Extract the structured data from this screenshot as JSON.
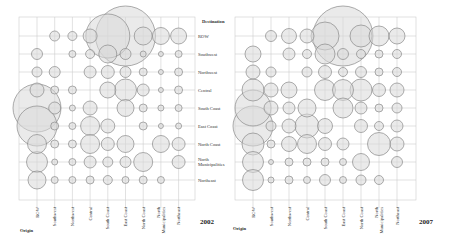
{
  "chart_data": [
    {
      "type": "bubble-matrix",
      "title": "2002",
      "xlabel": "Origin",
      "ylabel": "Destination",
      "categories_x": [
        "ROW",
        "Southwest",
        "Northwest",
        "Central",
        "South Coast",
        "East Coast",
        "North Coast",
        "North Municipalities",
        "Northeast"
      ],
      "categories_y": [
        "ROW",
        "Southwest",
        "Northwest",
        "Central",
        "South Coast",
        "East Coast",
        "North Coast",
        "North Municipalities",
        "Northeast"
      ],
      "grid": true,
      "radii_px": [
        [
          0,
          5,
          4.5,
          7,
          22,
          30,
          9,
          8.5,
          8
        ],
        [
          5.5,
          0,
          3.5,
          4.5,
          9,
          5.5,
          3,
          2.5,
          3.5
        ],
        [
          5,
          5.5,
          0,
          6,
          6.5,
          5.5,
          4,
          2.5,
          4
        ],
        [
          7,
          4,
          4,
          0,
          8,
          11,
          6,
          2.5,
          4
        ],
        [
          24,
          6,
          3,
          7,
          0,
          8.5,
          4,
          3,
          3.5
        ],
        [
          20,
          4,
          3.5,
          9.5,
          7,
          0,
          4,
          2.5,
          3
        ],
        [
          9.5,
          4,
          4,
          9.5,
          6.5,
          8.5,
          0,
          8.5,
          6.5
        ],
        [
          10.5,
          3,
          3.5,
          6,
          5,
          5.5,
          9.5,
          0,
          6.5
        ],
        [
          9,
          3.5,
          3.5,
          4,
          4.5,
          3.5,
          4,
          3.5,
          0
        ]
      ]
    },
    {
      "type": "bubble-matrix",
      "title": "2007",
      "xlabel": "Origin",
      "ylabel": "Destination",
      "categories_x": [
        "ROW",
        "Southwest",
        "Northwest",
        "Central",
        "South Coast",
        "East Coast",
        "North Coast",
        "North Municipalities",
        "Northeast"
      ],
      "categories_y": [
        "ROW",
        "Southwest",
        "Northwest",
        "Central",
        "South Coast",
        "East Coast",
        "North Coast",
        "North Municipalities",
        "Northeast"
      ],
      "grid": true,
      "radii_px": [
        [
          0,
          5.5,
          7.5,
          7,
          14,
          30,
          11,
          10,
          8
        ],
        [
          8,
          0,
          6,
          4.5,
          10,
          5.5,
          4.5,
          4,
          4.5
        ],
        [
          7,
          5,
          0,
          5,
          6.5,
          4.5,
          5.5,
          4,
          4.5
        ],
        [
          11,
          7,
          8,
          0,
          10.5,
          10.5,
          11,
          6.5,
          7
        ],
        [
          18,
          7,
          6,
          9,
          0,
          10,
          6,
          4,
          5
        ],
        [
          20,
          5,
          7,
          12,
          7.5,
          0,
          6.5,
          4.5,
          6
        ],
        [
          11,
          4,
          7.5,
          9.5,
          6.5,
          6,
          0,
          11.5,
          7
        ],
        [
          10.5,
          2.5,
          4,
          4,
          4,
          3.5,
          8.5,
          0,
          5.5
        ],
        [
          10.5,
          3,
          4,
          3.5,
          5.5,
          3.5,
          5,
          4.5,
          0
        ]
      ]
    }
  ],
  "panels": [
    {
      "year": "2002",
      "destination_title": "Destination",
      "origin_title": "Origin",
      "row_labels": [
        "ROW",
        "Southwest",
        "Northwest",
        "Central",
        "South Coast",
        "East Coast",
        "North Coast",
        "North Municipalities",
        "Northeast"
      ],
      "col_labels": [
        "ROW",
        "Southwest",
        "Northwest",
        "Central",
        "South Coast",
        "East Coast",
        "North Coast",
        "North Municipalities",
        "Northeast"
      ]
    },
    {
      "year": "2007",
      "origin_title": "Origin",
      "col_labels": [
        "ROW",
        "Southwest",
        "Northwest",
        "Central",
        "South Coast",
        "East Coast",
        "North Coast",
        "North Municipalities",
        "Northeast"
      ]
    }
  ],
  "style": {
    "bubble_fill": "#d9d9d9",
    "bubble_stroke": "#8a8a8a",
    "grid_color": "#cccccc"
  }
}
